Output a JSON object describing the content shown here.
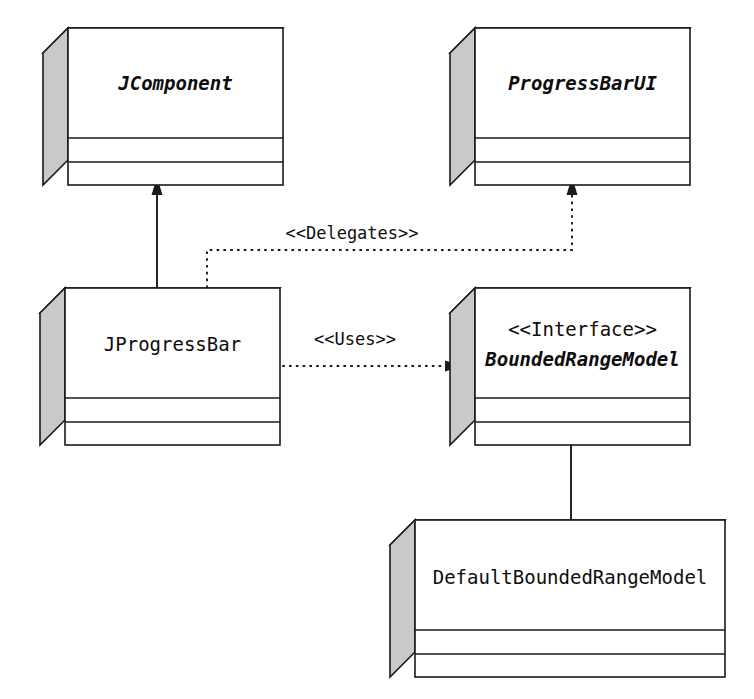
{
  "diagram": {
    "kind": "uml-class-diagram",
    "background_color": "#ffffff",
    "line_color": "#1a1a1a",
    "box_fill_color": "#ffffff",
    "box_shade_color": "#c9c9c9"
  },
  "classes": [
    {
      "id": "jcomponent",
      "name": "JComponent",
      "stereotype": "",
      "style": "abstract",
      "x": 43,
      "y": 28,
      "width": 215,
      "height": 157
    },
    {
      "id": "progressbarui",
      "name": "ProgressBarUI",
      "stereotype": "",
      "style": "abstract",
      "x": 450,
      "y": 28,
      "width": 215,
      "height": 157
    },
    {
      "id": "jprogressbar",
      "name": "JProgressBar",
      "stereotype": "",
      "style": "concrete",
      "x": 40,
      "y": 288,
      "width": 215,
      "height": 157
    },
    {
      "id": "boundedrangemodel",
      "name": "BoundedRangeModel",
      "stereotype": "<<Interface>>",
      "style": "abstract",
      "x": 450,
      "y": 288,
      "width": 215,
      "height": 157
    },
    {
      "id": "defaultboundedrangemodel",
      "name": "DefaultBoundedRangeModel",
      "stereotype": "",
      "style": "concrete",
      "x": 390,
      "y": 520,
      "width": 310,
      "height": 157
    }
  ],
  "relationships": [
    {
      "id": "inheritance",
      "from": "jprogressbar",
      "to": "jcomponent",
      "type": "generalization",
      "line": "solid",
      "label": ""
    },
    {
      "id": "delegates",
      "from": "jprogressbar",
      "to": "progressbarui",
      "type": "dependency",
      "line": "dotted",
      "label": "<<Delegates>>"
    },
    {
      "id": "uses",
      "from": "jprogressbar",
      "to": "boundedrangemodel",
      "type": "dependency",
      "line": "dotted",
      "label": "<<Uses>>"
    },
    {
      "id": "composition",
      "from": "boundedrangemodel",
      "to": "defaultboundedrangemodel",
      "type": "composition",
      "line": "solid",
      "label": ""
    }
  ],
  "labels": {
    "delegates": "<<Delegates>>",
    "uses": "<<Uses>>"
  }
}
